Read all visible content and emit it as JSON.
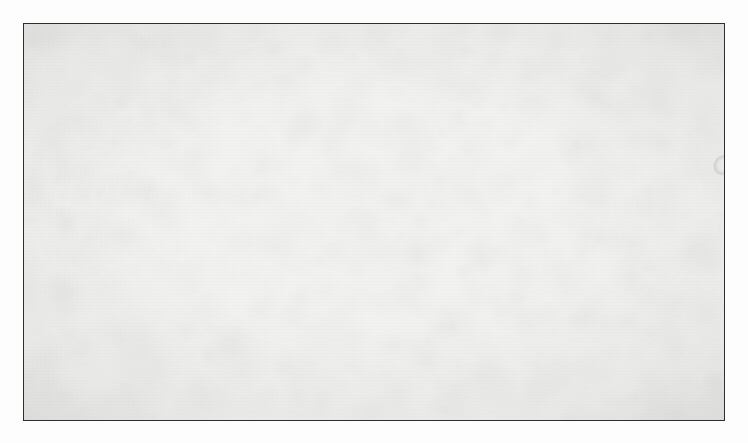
{
  "figure": {
    "domain_label": "photomicrograph",
    "specimen": "peripheral blood smear",
    "stain_appearance": "grayscale halftone print",
    "caption": "",
    "frame": {
      "left": 23,
      "top": 23,
      "width": 702,
      "height": 398,
      "border_color": "#2f2f31",
      "border_width_px": 1.5
    },
    "colors": {
      "page_margin": "#fdfdfd",
      "field_background": "#f2f2f0",
      "rbc_rim": "#9a9a9a",
      "rbc_body": "#b4b4b2",
      "rbc_central_pallor": "#e8e8e6",
      "rbc_dark_edge": "#7d7d7d",
      "wbc_nucleus": "#2a2a2c",
      "wbc_cytoplasm": "#c9c9c7",
      "platelet": "#6e6e70"
    },
    "content": {
      "red_blood_cells_visible": 420,
      "white_blood_cells_visible": 1,
      "white_blood_cell_type": "segmented neutrophil",
      "white_blood_cell_center": {
        "x": 326,
        "y": 180
      },
      "white_blood_cell_diameter_px": 26,
      "platelets_visible": 3,
      "mean_rbc_diameter_px": 19
    },
    "seed": 20240917
  },
  "chart_data": {
    "type": "scatter",
    "title": "",
    "xlabel": "",
    "ylabel": "",
    "note": "cell field positions are procedurally distributed; not a measured dataset"
  }
}
